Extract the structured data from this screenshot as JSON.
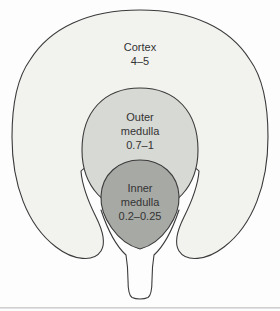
{
  "diagram": {
    "regions": [
      {
        "id": "cortex",
        "lines": [
          "Cortex",
          "4–5"
        ],
        "fill": "#f2f2ef"
      },
      {
        "id": "outer-medulla",
        "lines": [
          "Outer",
          "medulla",
          "0.7–1"
        ],
        "fill": "#d7d9d5"
      },
      {
        "id": "inner-medulla",
        "lines": [
          "Inner",
          "medulla",
          "0.2–0.25"
        ],
        "fill": "#a7a9a5"
      }
    ],
    "pelvis_fill": "#fdfdfd",
    "colors": {
      "background": "#fdfdfd",
      "outline": "#3a3a3a",
      "text": "#333333",
      "page_edge_line": "#c8c8c8"
    }
  }
}
